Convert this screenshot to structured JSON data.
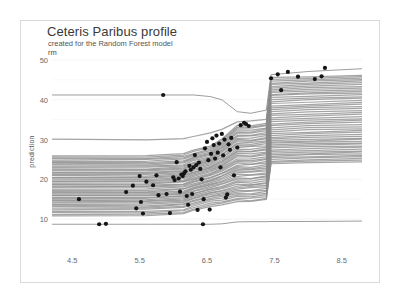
{
  "chart_data": {
    "type": "line",
    "title": "Ceteris Paribus profile",
    "subtitle": "created for the Random Forest model",
    "strip_label": "rm",
    "xlabel": "",
    "ylabel": "prediction",
    "xlim": [
      4.2,
      8.8
    ],
    "ylim": [
      6.5,
      51
    ],
    "xticks": [
      4.5,
      5.5,
      6.5,
      7.5,
      8.5
    ],
    "xtick_labels": [
      "4.5",
      "5.5",
      "6.5",
      "7.5",
      "8.5"
    ],
    "yticks": [
      10,
      20,
      30,
      40,
      50
    ],
    "ytick_labels": [
      "10",
      "20",
      "30",
      "40",
      "50"
    ],
    "grid": "horizontal-minor",
    "line_color": "#8c8c8c",
    "point_color": "#151515",
    "background": "#ffffff",
    "frame_color": "#d9d9d9",
    "series_note": "Ceteris paribus profiles: prediction vs rm for many observations; step increases near rm=6.2, 6.75 and 7.4",
    "profiles": [
      {
        "name": "p01",
        "base": 41.2,
        "step1": 41.1,
        "step2": 36.0,
        "step3": 46.3,
        "end": 47.8
      },
      {
        "name": "p02",
        "base": 30.0,
        "step1": 31.6,
        "step2": 34.5,
        "step3": 45.6,
        "end": 46.1
      },
      {
        "name": "p03",
        "base": 26.0,
        "step1": 28.4,
        "step2": 33.5,
        "step3": 45.0,
        "end": 45.8
      },
      {
        "name": "p04",
        "base": 25.6,
        "step1": 28.0,
        "step2": 33.2,
        "step3": 44.6,
        "end": 45.4
      },
      {
        "name": "p05",
        "base": 25.2,
        "step1": 27.6,
        "step2": 32.8,
        "step3": 44.2,
        "end": 45.0
      },
      {
        "name": "p06",
        "base": 24.9,
        "step1": 27.2,
        "step2": 32.4,
        "step3": 43.8,
        "end": 44.6
      },
      {
        "name": "p07",
        "base": 24.6,
        "step1": 26.9,
        "step2": 32.0,
        "step3": 43.4,
        "end": 44.2
      },
      {
        "name": "p08",
        "base": 24.3,
        "step1": 26.6,
        "step2": 31.6,
        "step3": 43.0,
        "end": 43.8
      },
      {
        "name": "p09",
        "base": 24.0,
        "step1": 26.3,
        "step2": 31.2,
        "step3": 42.6,
        "end": 43.4
      },
      {
        "name": "p10",
        "base": 23.6,
        "step1": 26.0,
        "step2": 30.8,
        "step3": 42.2,
        "end": 43.0
      },
      {
        "name": "p11",
        "base": 23.3,
        "step1": 25.7,
        "step2": 30.4,
        "step3": 41.8,
        "end": 42.6
      },
      {
        "name": "p12",
        "base": 23.0,
        "step1": 25.4,
        "step2": 30.0,
        "step3": 41.4,
        "end": 42.2
      },
      {
        "name": "p13",
        "base": 22.7,
        "step1": 25.1,
        "step2": 29.6,
        "step3": 41.0,
        "end": 41.8
      },
      {
        "name": "p14",
        "base": 22.4,
        "step1": 24.8,
        "step2": 29.2,
        "step3": 40.5,
        "end": 41.3
      },
      {
        "name": "p15",
        "base": 22.1,
        "step1": 24.5,
        "step2": 28.8,
        "step3": 40.0,
        "end": 40.8
      },
      {
        "name": "p16",
        "base": 21.8,
        "step1": 24.2,
        "step2": 28.4,
        "step3": 39.5,
        "end": 40.3
      },
      {
        "name": "p17",
        "base": 21.5,
        "step1": 23.9,
        "step2": 28.0,
        "step3": 39.0,
        "end": 39.8
      },
      {
        "name": "p18",
        "base": 21.2,
        "step1": 23.6,
        "step2": 27.6,
        "step3": 38.5,
        "end": 39.3
      },
      {
        "name": "p19",
        "base": 20.9,
        "step1": 23.3,
        "step2": 27.2,
        "step3": 38.0,
        "end": 38.8
      },
      {
        "name": "p20",
        "base": 20.6,
        "step1": 23.0,
        "step2": 26.8,
        "step3": 37.5,
        "end": 38.3
      },
      {
        "name": "p21",
        "base": 20.3,
        "step1": 22.7,
        "step2": 26.4,
        "step3": 37.0,
        "end": 37.8
      },
      {
        "name": "p22",
        "base": 20.0,
        "step1": 22.4,
        "step2": 26.0,
        "step3": 36.5,
        "end": 37.3
      },
      {
        "name": "p23",
        "base": 19.7,
        "step1": 22.1,
        "step2": 25.6,
        "step3": 36.0,
        "end": 36.8
      },
      {
        "name": "p24",
        "base": 19.4,
        "step1": 21.8,
        "step2": 25.2,
        "step3": 35.5,
        "end": 36.3
      },
      {
        "name": "p25",
        "base": 19.1,
        "step1": 21.5,
        "step2": 24.8,
        "step3": 35.0,
        "end": 35.8
      },
      {
        "name": "p26",
        "base": 18.8,
        "step1": 21.2,
        "step2": 24.4,
        "step3": 34.5,
        "end": 35.3
      },
      {
        "name": "p27",
        "base": 18.5,
        "step1": 20.9,
        "step2": 24.0,
        "step3": 34.0,
        "end": 34.8
      },
      {
        "name": "p28",
        "base": 18.2,
        "step1": 20.6,
        "step2": 23.6,
        "step3": 33.5,
        "end": 34.3
      },
      {
        "name": "p29",
        "base": 17.9,
        "step1": 20.3,
        "step2": 23.2,
        "step3": 33.0,
        "end": 33.8
      },
      {
        "name": "p30",
        "base": 17.6,
        "step1": 20.0,
        "step2": 22.8,
        "step3": 32.5,
        "end": 33.3
      },
      {
        "name": "p31",
        "base": 17.3,
        "step1": 19.7,
        "step2": 22.4,
        "step3": 32.0,
        "end": 32.8
      },
      {
        "name": "p32",
        "base": 17.0,
        "step1": 19.4,
        "step2": 22.0,
        "step3": 31.5,
        "end": 32.3
      },
      {
        "name": "p33",
        "base": 16.7,
        "step1": 19.1,
        "step2": 21.6,
        "step3": 31.0,
        "end": 31.8
      },
      {
        "name": "p34",
        "base": 16.4,
        "step1": 18.8,
        "step2": 21.2,
        "step3": 30.5,
        "end": 31.3
      },
      {
        "name": "p35",
        "base": 16.1,
        "step1": 18.5,
        "step2": 20.8,
        "step3": 30.2,
        "end": 30.9
      },
      {
        "name": "p36",
        "base": 15.8,
        "step1": 18.2,
        "step2": 20.4,
        "step3": 29.8,
        "end": 30.4
      },
      {
        "name": "p37",
        "base": 15.5,
        "step1": 17.9,
        "step2": 20.0,
        "step3": 29.4,
        "end": 30.0
      },
      {
        "name": "p38",
        "base": 15.2,
        "step1": 17.6,
        "step2": 19.6,
        "step3": 29.0,
        "end": 29.6
      },
      {
        "name": "p39",
        "base": 14.9,
        "step1": 17.3,
        "step2": 19.2,
        "step3": 28.6,
        "end": 29.2
      },
      {
        "name": "p40",
        "base": 14.6,
        "step1": 17.0,
        "step2": 18.8,
        "step3": 28.2,
        "end": 28.8
      },
      {
        "name": "p41",
        "base": 14.3,
        "step1": 16.7,
        "step2": 18.4,
        "step3": 27.8,
        "end": 28.4
      },
      {
        "name": "p42",
        "base": 14.0,
        "step1": 16.4,
        "step2": 18.0,
        "step3": 27.4,
        "end": 28.0
      },
      {
        "name": "p43",
        "base": 13.7,
        "step1": 16.1,
        "step2": 17.6,
        "step3": 27.0,
        "end": 27.6
      },
      {
        "name": "p44",
        "base": 13.4,
        "step1": 15.8,
        "step2": 17.2,
        "step3": 26.6,
        "end": 27.2
      },
      {
        "name": "p45",
        "base": 13.1,
        "step1": 15.5,
        "step2": 16.8,
        "step3": 26.2,
        "end": 26.8
      },
      {
        "name": "p46",
        "base": 12.8,
        "step1": 15.2,
        "step2": 16.4,
        "step3": 25.8,
        "end": 26.4
      },
      {
        "name": "p47",
        "base": 12.4,
        "step1": 14.8,
        "step2": 16.0,
        "step3": 25.4,
        "end": 26.0
      },
      {
        "name": "p48",
        "base": 12.0,
        "step1": 14.4,
        "step2": 15.6,
        "step3": 25.0,
        "end": 25.6
      },
      {
        "name": "p49",
        "base": 11.6,
        "step1": 14.0,
        "step2": 15.2,
        "step3": 24.6,
        "end": 25.2
      },
      {
        "name": "p50",
        "base": 11.2,
        "step1": 13.6,
        "step2": 14.8,
        "step3": 24.2,
        "end": 24.8
      },
      {
        "name": "p51",
        "base": 10.9,
        "step1": 13.2,
        "step2": 14.4,
        "step3": 23.9,
        "end": 24.4
      },
      {
        "name": "p52",
        "base": 8.7,
        "step1": 8.7,
        "step2": 9.3,
        "step3": 9.4,
        "end": 9.5
      }
    ],
    "points": [
      {
        "x": 4.6,
        "y": 15.0
      },
      {
        "x": 4.9,
        "y": 8.7
      },
      {
        "x": 5.0,
        "y": 8.8
      },
      {
        "x": 5.3,
        "y": 16.8
      },
      {
        "x": 5.4,
        "y": 18.4
      },
      {
        "x": 5.45,
        "y": 12.7
      },
      {
        "x": 5.5,
        "y": 20.8
      },
      {
        "x": 5.52,
        "y": 14.3
      },
      {
        "x": 5.55,
        "y": 11.4
      },
      {
        "x": 5.6,
        "y": 19.4
      },
      {
        "x": 5.7,
        "y": 18.5
      },
      {
        "x": 5.75,
        "y": 21.0
      },
      {
        "x": 5.78,
        "y": 16.0
      },
      {
        "x": 5.85,
        "y": 41.2
      },
      {
        "x": 5.9,
        "y": 16.3
      },
      {
        "x": 5.95,
        "y": 11.5
      },
      {
        "x": 6.0,
        "y": 20.5
      },
      {
        "x": 6.02,
        "y": 19.8
      },
      {
        "x": 6.05,
        "y": 24.3
      },
      {
        "x": 6.08,
        "y": 20.2
      },
      {
        "x": 6.1,
        "y": 16.9
      },
      {
        "x": 6.12,
        "y": 21.2
      },
      {
        "x": 6.14,
        "y": 20.8
      },
      {
        "x": 6.16,
        "y": 21.5
      },
      {
        "x": 6.18,
        "y": 22.0
      },
      {
        "x": 6.2,
        "y": 15.8
      },
      {
        "x": 6.22,
        "y": 13.6
      },
      {
        "x": 6.24,
        "y": 23.4
      },
      {
        "x": 6.26,
        "y": 22.4
      },
      {
        "x": 6.28,
        "y": 16.3
      },
      {
        "x": 6.3,
        "y": 23.0
      },
      {
        "x": 6.32,
        "y": 26.1
      },
      {
        "x": 6.34,
        "y": 23.6
      },
      {
        "x": 6.36,
        "y": 12.3
      },
      {
        "x": 6.38,
        "y": 24.2
      },
      {
        "x": 6.4,
        "y": 22.6
      },
      {
        "x": 6.42,
        "y": 20.0
      },
      {
        "x": 6.44,
        "y": 8.7
      },
      {
        "x": 6.45,
        "y": 15.0
      },
      {
        "x": 6.47,
        "y": 27.8
      },
      {
        "x": 6.5,
        "y": 29.4
      },
      {
        "x": 6.52,
        "y": 24.8
      },
      {
        "x": 6.54,
        "y": 12.4
      },
      {
        "x": 6.56,
        "y": 26.4
      },
      {
        "x": 6.58,
        "y": 30.3
      },
      {
        "x": 6.6,
        "y": 28.6
      },
      {
        "x": 6.62,
        "y": 25.2
      },
      {
        "x": 6.64,
        "y": 31.0
      },
      {
        "x": 6.66,
        "y": 26.7
      },
      {
        "x": 6.68,
        "y": 29.0
      },
      {
        "x": 6.7,
        "y": 23.0
      },
      {
        "x": 6.72,
        "y": 31.4
      },
      {
        "x": 6.74,
        "y": 26.0
      },
      {
        "x": 6.76,
        "y": 30.0
      },
      {
        "x": 6.78,
        "y": 15.4
      },
      {
        "x": 6.8,
        "y": 16.2
      },
      {
        "x": 6.82,
        "y": 28.8
      },
      {
        "x": 6.84,
        "y": 27.4
      },
      {
        "x": 6.86,
        "y": 30.4
      },
      {
        "x": 6.9,
        "y": 21.0
      },
      {
        "x": 6.95,
        "y": 28.0
      },
      {
        "x": 7.0,
        "y": 33.6
      },
      {
        "x": 7.05,
        "y": 34.2
      },
      {
        "x": 7.08,
        "y": 33.9
      },
      {
        "x": 7.12,
        "y": 33.4
      },
      {
        "x": 7.45,
        "y": 45.4
      },
      {
        "x": 7.55,
        "y": 46.4
      },
      {
        "x": 7.6,
        "y": 42.4
      },
      {
        "x": 7.7,
        "y": 47.0
      },
      {
        "x": 7.85,
        "y": 45.8
      },
      {
        "x": 8.1,
        "y": 45.2
      },
      {
        "x": 8.2,
        "y": 45.9
      },
      {
        "x": 8.25,
        "y": 48.0
      }
    ]
  }
}
